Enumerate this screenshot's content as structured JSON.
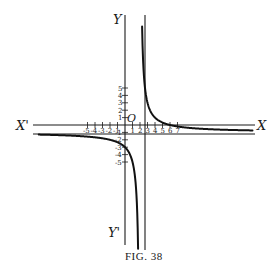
{
  "figure": {
    "caption": "Fig. 38",
    "caption_display": "FIG. 38"
  },
  "chart_data": {
    "type": "line",
    "title": "",
    "xlabel": "X",
    "xlabel_negative": "X'",
    "ylabel": "Y",
    "ylabel_negative": "Y'",
    "origin_label": "O",
    "function": "y = (6 - x) / (x - 2)",
    "asymptotes": {
      "vertical": 2,
      "horizontal": -1
    },
    "x_ticks": [
      -5,
      -4,
      -3,
      -2,
      -1,
      1,
      2,
      3,
      4,
      5,
      6,
      7
    ],
    "x_tick_labels": [
      "-5",
      "-4",
      "-3",
      "-2",
      "-1",
      "1",
      "2",
      "3",
      "4",
      "5",
      "6",
      "7"
    ],
    "y_ticks": [
      5,
      4,
      3,
      2,
      1,
      -1,
      -2,
      -3,
      -4,
      -5
    ],
    "y_tick_labels": [
      "5",
      "4",
      "3",
      "2",
      "1",
      "-1",
      "-2",
      "-3",
      "-4",
      "-5"
    ],
    "xlim": [
      -13,
      18
    ],
    "ylim": [
      -16,
      15
    ],
    "grid": false,
    "series": [
      {
        "name": "left branch (x < 2)",
        "x": [
          -12,
          -10,
          -8,
          -6,
          -4,
          -2,
          0,
          1,
          1.5,
          1.7,
          1.8
        ],
        "values": [
          -1.29,
          -1.33,
          -1.4,
          -1.5,
          -1.67,
          -2.0,
          -3.0,
          -5.0,
          -9.0,
          -14.33,
          -21.0
        ]
      },
      {
        "name": "right branch (x > 2)",
        "x": [
          2.35,
          2.5,
          3,
          4,
          5,
          6,
          7,
          8,
          10,
          12,
          15,
          17
        ],
        "values": [
          10.43,
          7.0,
          3.0,
          1.0,
          0.33,
          0.0,
          -0.2,
          -0.33,
          -0.5,
          -0.6,
          -0.69,
          -0.73
        ]
      }
    ],
    "key_points": [
      {
        "x": 0,
        "y": -3,
        "note": "y-intercept"
      },
      {
        "x": 6,
        "y": 0,
        "note": "x-intercept"
      }
    ]
  }
}
